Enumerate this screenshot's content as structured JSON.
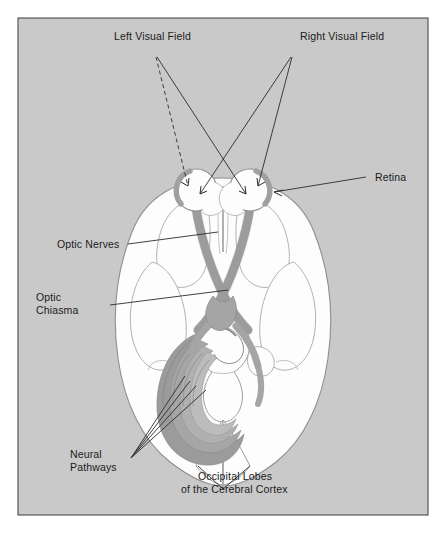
{
  "figure": {
    "background_color": "#c9c9c9",
    "frame_color": "#4a4a4a",
    "brain_fill": "#fdfdfd",
    "brain_outline": "#8c8c8c",
    "nerve_color": "#a8a8a8",
    "pathway_color": "#9a9a9a",
    "pathway_dark": "#8a8a8a",
    "line_color": "#2b2b2b"
  },
  "labels": {
    "left_visual_field": "Left Visual Field",
    "right_visual_field": "Right Visual Field",
    "retina": "Retina",
    "optic_nerves": "Optic Nerves",
    "optic_chiasma_line1": "Optic",
    "optic_chiasma_line2": "Chiasma",
    "neural_pathways_line1": "Neural",
    "neural_pathways_line2": "Pathways",
    "occipital_line1": "Occipital Lobes",
    "occipital_line2": "of the Cerebral Cortex"
  },
  "parts": [
    {
      "id": "left-eye",
      "name": "Left eyeball with retina"
    },
    {
      "id": "right-eye",
      "name": "Right eyeball with retina"
    },
    {
      "id": "optic-nerve-left",
      "name": "Left optic nerve"
    },
    {
      "id": "optic-nerve-right",
      "name": "Right optic nerve"
    },
    {
      "id": "optic-chiasma",
      "name": "Optic chiasma"
    },
    {
      "id": "neural-pathways",
      "name": "Neural pathways (optic radiations)"
    },
    {
      "id": "occipital-lobes",
      "name": "Occipital lobes of the cerebral cortex"
    }
  ]
}
